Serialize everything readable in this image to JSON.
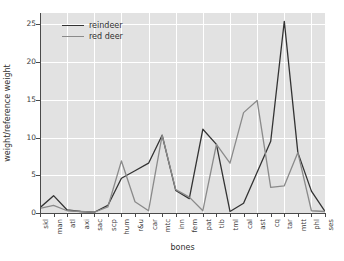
{
  "chart_data": {
    "type": "line",
    "title": "",
    "xlabel": "bones",
    "ylabel": "weight/reference weight",
    "ylim": [
      0,
      26.5
    ],
    "yticks": [
      0,
      5,
      10,
      15,
      20,
      25
    ],
    "grid": true,
    "legend_position": "top-left",
    "categories": [
      "skl",
      "man",
      "atl",
      "axi",
      "sac",
      "scp",
      "hum",
      "r&u",
      "car",
      "mtc",
      "inn",
      "fem",
      "pat",
      "tib",
      "tml",
      "cal",
      "ast",
      "cq",
      "tar",
      "mtt",
      "phl",
      "ses"
    ],
    "series": [
      {
        "name": "reindeer",
        "color": "#333333",
        "values": [
          0.7,
          2.3,
          0.4,
          0.2,
          0.1,
          1.0,
          4.6,
          5.6,
          6.6,
          10.3,
          3.0,
          1.9,
          11.1,
          9.1,
          0.2,
          1.3,
          5.4,
          9.5,
          25.4,
          8.0,
          2.9,
          0.2
        ]
      },
      {
        "name": "red deer",
        "color": "#8a8a8a",
        "values": [
          0.6,
          1.0,
          0.3,
          0.2,
          0.1,
          0.8,
          6.9,
          1.5,
          0.3,
          10.3,
          3.1,
          2.1,
          0.3,
          9.1,
          6.6,
          13.3,
          14.9,
          3.4,
          3.6,
          8.0,
          0.3,
          0.2
        ]
      }
    ]
  },
  "legend": {
    "entries": [
      {
        "label": "reindeer",
        "color": "#333333"
      },
      {
        "label": "red deer",
        "color": "#8a8a8a"
      }
    ]
  },
  "axes": {
    "y_title": "weight/reference weight",
    "x_title": "bones",
    "y_tick_labels": [
      "0",
      "5",
      "10",
      "15",
      "20",
      "25"
    ],
    "x_tick_labels": [
      "skl",
      "man",
      "atl",
      "axi",
      "sac",
      "scp",
      "hum",
      "r&u",
      "car",
      "mtc",
      "inn",
      "fem",
      "pat",
      "tib",
      "tml",
      "cal",
      "ast",
      "cq",
      "tar",
      "mtt",
      "phl",
      "ses"
    ]
  },
  "style": {
    "plot_background": "#e2e2e2",
    "grid_color": "#ffffff",
    "axis_color": "#4a4a4a",
    "figure_background": "#ffffff"
  }
}
